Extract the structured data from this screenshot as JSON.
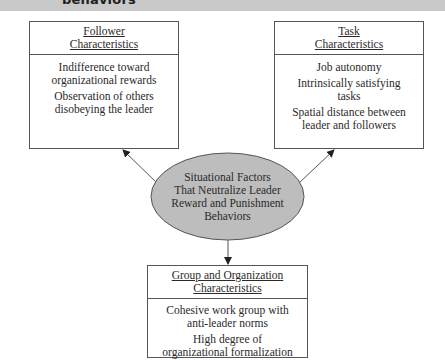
{
  "banner": {
    "title_fragment": "behaviors",
    "background": "#c9c9c9"
  },
  "center": {
    "lines": [
      "Situational Factors",
      "That Neutralize Leader",
      "Reward and Punishment",
      "Behaviors"
    ],
    "fill": "#bdbdbd"
  },
  "boxes": {
    "follower": {
      "title_lines": [
        "Follower",
        "Characteristics"
      ],
      "items": [
        "Indifference toward organizational rewards",
        "Observation of others disobeying the leader"
      ]
    },
    "task": {
      "title_lines": [
        "Task",
        "Characteristics"
      ],
      "items": [
        "Job autonomy",
        "Intrinsically satisfying tasks",
        "Spatial distance between leader and followers"
      ]
    },
    "group": {
      "title_lines": [
        "Group and Organization",
        "Characteristics"
      ],
      "items": [
        "Cohesive work group with anti-leader norms",
        "High degree of organizational formalization"
      ]
    }
  }
}
